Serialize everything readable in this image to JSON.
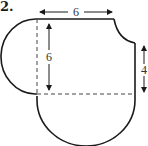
{
  "problem": {
    "number": "2."
  },
  "diagram": {
    "labels": {
      "top_width": "6",
      "left_height": "6",
      "right_height": "4"
    },
    "colors": {
      "stroke": "#1a1a1a",
      "dashed": "#444444",
      "text": "#333333"
    }
  }
}
